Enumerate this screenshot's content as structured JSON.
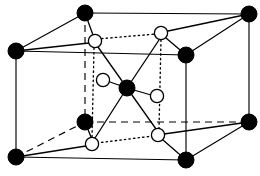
{
  "figure": {
    "kind": "crystal-structure-unit-cell",
    "title": "",
    "caption": "",
    "background_color": "#ffffff",
    "line_color": "#000000",
    "filled_atom_color": "#000000",
    "open_atom_color": "#ffffff",
    "width": 260,
    "height": 176
  },
  "legend": {
    "filled_atom_label": "",
    "open_atom_label": ""
  },
  "atoms": {
    "filled": [
      {
        "id": "corner-top-back-left",
        "name": "filled-atom-top-back-left",
        "x": 85,
        "y": 13,
        "r": 8.0
      },
      {
        "id": "corner-top-back-right",
        "name": "filled-atom-top-back-right",
        "x": 249,
        "y": 14,
        "r": 8.0
      },
      {
        "id": "corner-top-front-left",
        "name": "filled-atom-top-front-left",
        "x": 16,
        "y": 51,
        "r": 8.0
      },
      {
        "id": "corner-top-front-right",
        "name": "filled-atom-top-front-right",
        "x": 186,
        "y": 55,
        "r": 8.0
      },
      {
        "id": "corner-bot-back-left",
        "name": "filled-atom-bottom-back-left",
        "x": 85,
        "y": 122,
        "r": 8.0
      },
      {
        "id": "corner-bot-back-right",
        "name": "filled-atom-bottom-back-right",
        "x": 249,
        "y": 122,
        "r": 8.0
      },
      {
        "id": "corner-bot-front-left",
        "name": "filled-atom-bottom-front-left",
        "x": 16,
        "y": 157,
        "r": 8.0
      },
      {
        "id": "corner-bot-front-right",
        "name": "filled-atom-bottom-front-right",
        "x": 186,
        "y": 160,
        "r": 8.0
      },
      {
        "id": "center-atom",
        "name": "filled-atom-center",
        "x": 127,
        "y": 88,
        "r": 8.0
      }
    ],
    "open": [
      {
        "id": "open-upper-left",
        "name": "open-atom-upper-left",
        "x": 95,
        "y": 41,
        "r": 6.6
      },
      {
        "id": "open-upper-right",
        "name": "open-atom-upper-right",
        "x": 161,
        "y": 33,
        "r": 6.6
      },
      {
        "id": "open-mid-left",
        "name": "open-atom-mid-left",
        "x": 103,
        "y": 80,
        "r": 6.6
      },
      {
        "id": "open-mid-right",
        "name": "open-atom-mid-right",
        "x": 157,
        "y": 96,
        "r": 6.6
      },
      {
        "id": "open-lower-left",
        "name": "open-atom-lower-left",
        "x": 92,
        "y": 144,
        "r": 6.6
      },
      {
        "id": "open-lower-right",
        "name": "open-atom-lower-right",
        "x": 158,
        "y": 135,
        "r": 6.6
      }
    ]
  },
  "cell_edges_solid": [
    {
      "name": "edge-top-back",
      "x1": 85,
      "y1": 13,
      "x2": 249,
      "y2": 14
    },
    {
      "name": "edge-top-front",
      "x1": 16,
      "y1": 51,
      "x2": 186,
      "y2": 55
    },
    {
      "name": "edge-top-left-diagonal",
      "x1": 16,
      "y1": 51,
      "x2": 85,
      "y2": 13
    },
    {
      "name": "edge-top-right-diagonal",
      "x1": 186,
      "y1": 55,
      "x2": 249,
      "y2": 14
    },
    {
      "name": "edge-bottom-front",
      "x1": 16,
      "y1": 157,
      "x2": 186,
      "y2": 160
    },
    {
      "name": "edge-bottom-right-diagonal",
      "x1": 186,
      "y1": 160,
      "x2": 249,
      "y2": 122
    },
    {
      "name": "edge-vert-front-left",
      "x1": 16,
      "y1": 51,
      "x2": 16,
      "y2": 157
    },
    {
      "name": "edge-vert-front-right",
      "x1": 186,
      "y1": 55,
      "x2": 186,
      "y2": 160
    },
    {
      "name": "edge-vert-back-right",
      "x1": 249,
      "y1": 14,
      "x2": 249,
      "y2": 122
    }
  ],
  "cell_edges_dashed": [
    {
      "name": "edge-vert-back-left",
      "x1": 85,
      "y1": 13,
      "x2": 85,
      "y2": 122
    },
    {
      "name": "edge-bottom-back",
      "x1": 85,
      "y1": 122,
      "x2": 249,
      "y2": 122
    },
    {
      "name": "edge-bottom-left-diagonal",
      "x1": 16,
      "y1": 157,
      "x2": 85,
      "y2": 122
    }
  ],
  "dotted_outline": [
    {
      "name": "dotted-top-connector",
      "x1": 97,
      "y1": 39,
      "x2": 156,
      "y2": 34
    },
    {
      "name": "dotted-bottom-connector",
      "x1": 97,
      "y1": 143,
      "x2": 153,
      "y2": 136
    },
    {
      "name": "dotted-left-vertical",
      "x1": 94,
      "y1": 48,
      "x2": 92,
      "y2": 138
    },
    {
      "name": "dotted-right-vertical",
      "x1": 161,
      "y1": 40,
      "x2": 159,
      "y2": 129
    }
  ],
  "bonds": [
    {
      "name": "bond-center-to-open-mid-left",
      "x1": 127,
      "y1": 88,
      "x2": 110,
      "y2": 82
    },
    {
      "name": "bond-center-to-open-mid-right",
      "x1": 127,
      "y1": 88,
      "x2": 151,
      "y2": 95
    },
    {
      "name": "bond-center-to-open-upper-left",
      "x1": 127,
      "y1": 88,
      "x2": 98,
      "y2": 47
    },
    {
      "name": "bond-center-to-open-upper-right",
      "x1": 127,
      "y1": 88,
      "x2": 159,
      "y2": 40
    },
    {
      "name": "bond-center-to-open-lower-left",
      "x1": 127,
      "y1": 88,
      "x2": 95,
      "y2": 138
    },
    {
      "name": "bond-center-to-open-lower-right",
      "x1": 127,
      "y1": 88,
      "x2": 156,
      "y2": 129
    },
    {
      "name": "bond-topbackleft-to-open-upper-left",
      "x1": 85,
      "y1": 13,
      "x2": 93,
      "y2": 35
    },
    {
      "name": "bond-topfrontleft-to-open-upper-left",
      "x1": 16,
      "y1": 51,
      "x2": 89,
      "y2": 43
    },
    {
      "name": "bond-topfrontright-to-open-upper-right",
      "x1": 186,
      "y1": 55,
      "x2": 166,
      "y2": 38
    },
    {
      "name": "bond-topbackright-to-open-upper-right",
      "x1": 249,
      "y1": 14,
      "x2": 168,
      "y2": 31
    },
    {
      "name": "bond-botbackleft-to-open-lower-left",
      "x1": 85,
      "y1": 122,
      "x2": 91,
      "y2": 137
    },
    {
      "name": "bond-botfrontleft-to-open-lower-left",
      "x1": 16,
      "y1": 157,
      "x2": 86,
      "y2": 146
    },
    {
      "name": "bond-botfrontright-to-open-lower-right",
      "x1": 186,
      "y1": 160,
      "x2": 163,
      "y2": 140
    },
    {
      "name": "bond-botbackright-to-open-lower-right",
      "x1": 249,
      "y1": 122,
      "x2": 164,
      "y2": 134
    }
  ]
}
